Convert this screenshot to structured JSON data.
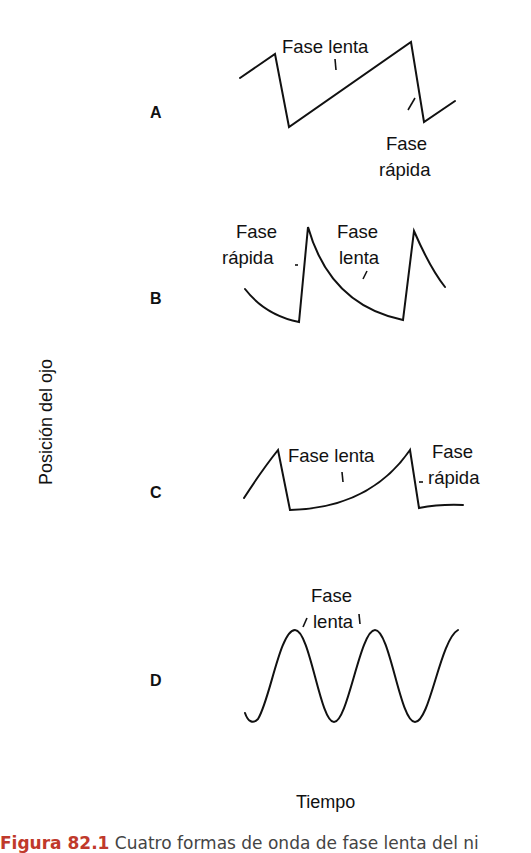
{
  "axes": {
    "ylabel": "Posición del ojo",
    "xlabel": "Tiempo"
  },
  "panels": [
    {
      "letter": "A",
      "labels": [
        "Fase lenta",
        "Fase",
        "rápida"
      ]
    },
    {
      "letter": "B",
      "labels": [
        "Fase",
        "rápida",
        "Fase",
        "lenta"
      ]
    },
    {
      "letter": "C",
      "labels": [
        "Fase lenta",
        "Fase",
        "rápida"
      ]
    },
    {
      "letter": "D",
      "labels": [
        "Fase",
        "lenta"
      ]
    }
  ],
  "caption": {
    "figure_label": "Figura 82.1",
    "text": "Cuatro formas de onda de fase lenta del ni"
  },
  "colors": {
    "stroke": "#111111",
    "caption_label": "#c0392b",
    "caption_text": "#444444"
  }
}
